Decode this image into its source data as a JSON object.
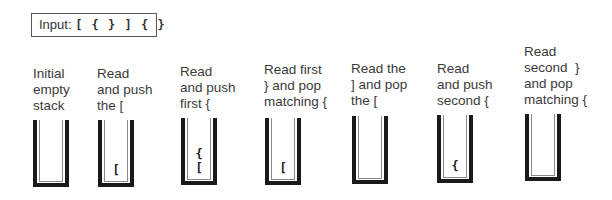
{
  "input": {
    "label": "Input:",
    "sequence": "[ { } ] { }"
  },
  "steps": [
    {
      "caption": "Initial\nempty\nstack",
      "stack": []
    },
    {
      "caption": "Read\nand push\nthe [",
      "stack": [
        "["
      ]
    },
    {
      "caption": "Read\nand push\nfirst {",
      "stack": [
        "[",
        "{"
      ]
    },
    {
      "caption": "Read first\n} and pop\nmatching {",
      "stack": [
        "["
      ]
    },
    {
      "caption": "Read the\n] and pop\nthe [",
      "stack": []
    },
    {
      "caption": "Read\nand push\nsecond {",
      "stack": [
        "{"
      ]
    },
    {
      "caption": "Read\nsecond  }\nand pop\nmatching {",
      "stack": []
    }
  ]
}
